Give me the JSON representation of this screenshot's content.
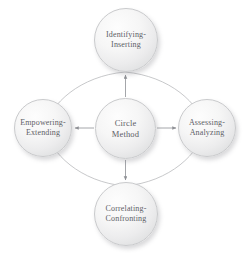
{
  "diagram": {
    "title": "Circle Method",
    "type": "cycle-diagram",
    "background_color": "#ffffff",
    "node_fill_color": "#ededee",
    "node_border_color": "#c9cacc",
    "text_color": "#5d6066",
    "connector_color": "#9a9ca0",
    "center_node": {
      "id": "circle-method",
      "label": "Circle\nMethod"
    },
    "outer_nodes": [
      {
        "id": "identifying-inserting",
        "label": "Identifying-\nInserting",
        "position": "top"
      },
      {
        "id": "assessing-analyzing",
        "label": "Assessing-\nAnalyzing",
        "position": "right"
      },
      {
        "id": "correlating-confronting",
        "label": "Correlating-\nConfronting",
        "position": "bottom"
      },
      {
        "id": "empowering-extending",
        "label": "Empowering-\nExtending",
        "position": "left"
      }
    ],
    "arrows": [
      {
        "from": "circle-method",
        "to": "identifying-inserting",
        "direction": "up"
      },
      {
        "from": "circle-method",
        "to": "assessing-analyzing",
        "direction": "right"
      },
      {
        "from": "circle-method",
        "to": "correlating-confronting",
        "direction": "down"
      },
      {
        "from": "circle-method",
        "to": "empowering-extending",
        "direction": "left"
      }
    ],
    "ring": {
      "description": "faint circular arc connecting the four outer nodes",
      "style": "thin-curve"
    }
  }
}
